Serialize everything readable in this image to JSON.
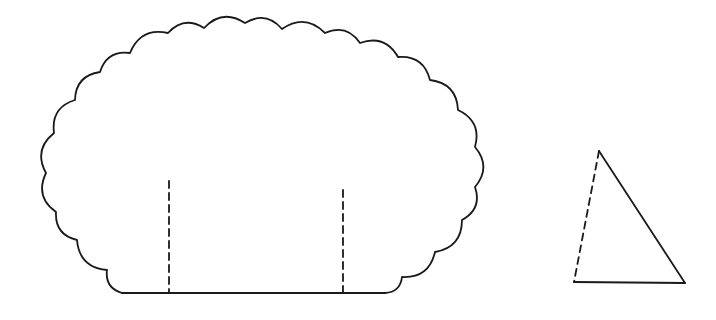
{
  "diagram": {
    "background": "#ffffff",
    "ink_color": "#1a1a1a",
    "shapes": [
      {
        "id": "scalloped-shape",
        "type": "scalloped-outline",
        "base": {
          "x1": 122,
          "x2": 385,
          "y": 293
        },
        "cusps": [
          [
            122,
            293
          ],
          [
            107,
            270
          ],
          [
            77,
            240
          ],
          [
            56,
            212
          ],
          [
            46,
            173
          ],
          [
            54,
            133
          ],
          [
            75,
            100
          ],
          [
            100,
            72
          ],
          [
            130,
            53
          ],
          [
            168,
            33
          ],
          [
            204,
            28
          ],
          [
            245,
            23
          ],
          [
            282,
            29
          ],
          [
            325,
            33
          ],
          [
            360,
            43
          ],
          [
            398,
            57
          ],
          [
            430,
            80
          ],
          [
            458,
            110
          ],
          [
            475,
            147
          ],
          [
            475,
            187
          ],
          [
            462,
            220
          ],
          [
            435,
            252
          ],
          [
            402,
            277
          ],
          [
            385,
            293
          ]
        ],
        "dashed_lines": [
          {
            "x": 169,
            "y1": 181,
            "y2": 293
          },
          {
            "x": 343,
            "y1": 190,
            "y2": 293
          }
        ]
      },
      {
        "id": "triangle",
        "type": "triangle",
        "vertices": {
          "apex": [
            599,
            151
          ],
          "bottom_left": [
            574,
            282
          ],
          "bottom_right": [
            685,
            283
          ]
        },
        "dashed_side": "apex-to-bottom-left"
      }
    ]
  }
}
